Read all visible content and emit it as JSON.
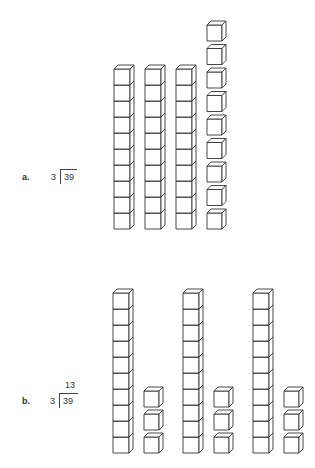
{
  "problem_a": {
    "label": "a.",
    "divisor": "3",
    "dividend": "39",
    "quotient": "",
    "model": {
      "tens_rods": 3,
      "ones_cubes": 9
    }
  },
  "problem_b": {
    "label": "b.",
    "divisor": "3",
    "dividend": "39",
    "quotient": "13",
    "model": {
      "groups": 3,
      "tens_rods_per_group": 1,
      "ones_cubes_per_group": 3
    }
  },
  "colors": {
    "stroke": "#333333",
    "fill": "#ffffff"
  }
}
